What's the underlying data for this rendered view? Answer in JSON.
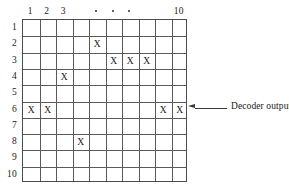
{
  "figure": {
    "type": "decoder-output-grid",
    "grid": {
      "rows": 10,
      "cols": 10
    },
    "column_headers": [
      {
        "col": 1,
        "label": "1",
        "kind": "number"
      },
      {
        "col": 2,
        "label": "2",
        "kind": "number"
      },
      {
        "col": 3,
        "label": "3",
        "kind": "number"
      },
      {
        "col": 4,
        "label": "",
        "kind": "blank"
      },
      {
        "col": 5,
        "label": "•",
        "kind": "dot"
      },
      {
        "col": 6,
        "label": "•",
        "kind": "dot"
      },
      {
        "col": 7,
        "label": "•",
        "kind": "dot"
      },
      {
        "col": 8,
        "label": "",
        "kind": "blank"
      },
      {
        "col": 9,
        "label": "",
        "kind": "blank"
      },
      {
        "col": 10,
        "label": "10",
        "kind": "number"
      }
    ],
    "row_headers": [
      "1",
      "2",
      "3",
      "4",
      "5",
      "6",
      "7",
      "8",
      "9",
      "10"
    ],
    "mark_glyph": "X",
    "marks": [
      {
        "row": 2,
        "col": 5
      },
      {
        "row": 3,
        "col": 6
      },
      {
        "row": 3,
        "col": 7
      },
      {
        "row": 3,
        "col": 8
      },
      {
        "row": 4,
        "col": 3
      },
      {
        "row": 6,
        "col": 1
      },
      {
        "row": 6,
        "col": 2
      },
      {
        "row": 6,
        "col": 9
      },
      {
        "row": 6,
        "col": 10
      },
      {
        "row": 8,
        "col": 4
      }
    ],
    "annotation": {
      "label": "Decoder output",
      "target_row": 6,
      "arrow_direction": "left"
    },
    "colors": {
      "line": "#5a5a5a",
      "border": "#4d4d4d",
      "text": "#1a1a1a",
      "background": "#ffffff",
      "arrow": "#3a3a3a"
    }
  }
}
